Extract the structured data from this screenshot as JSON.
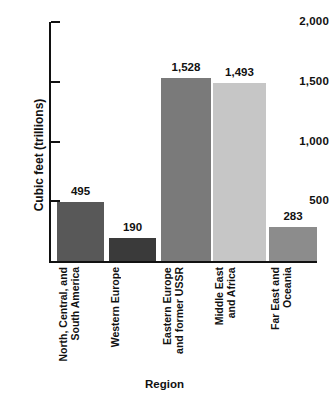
{
  "chart_data": {
    "type": "bar",
    "title": "",
    "xlabel": "Region",
    "ylabel": "Cubic feet (trillions)",
    "categories": [
      "North, Central, and\nSouth America",
      "Western Europe",
      "Eastern Europe\nand former USSR",
      "Middle East\nand Africa",
      "Far East and\nOceania"
    ],
    "values": [
      495,
      190,
      1528,
      1493,
      283
    ],
    "value_labels": [
      "495",
      "190",
      "1,528",
      "1,493",
      "283"
    ],
    "bar_colors": [
      "#585858",
      "#3a3a3a",
      "#7a7a7a",
      "#c6c6c6",
      "#8c8c8c"
    ],
    "ylim": [
      0,
      2000
    ],
    "yticks": [
      500,
      1000,
      1500,
      2000
    ],
    "ytick_labels": [
      "500",
      "1,000",
      "1,500",
      "2,000"
    ],
    "grid": false,
    "legend": null
  },
  "axis": {
    "y_title": "Cubic feet (trillions)",
    "x_title": "Region"
  }
}
